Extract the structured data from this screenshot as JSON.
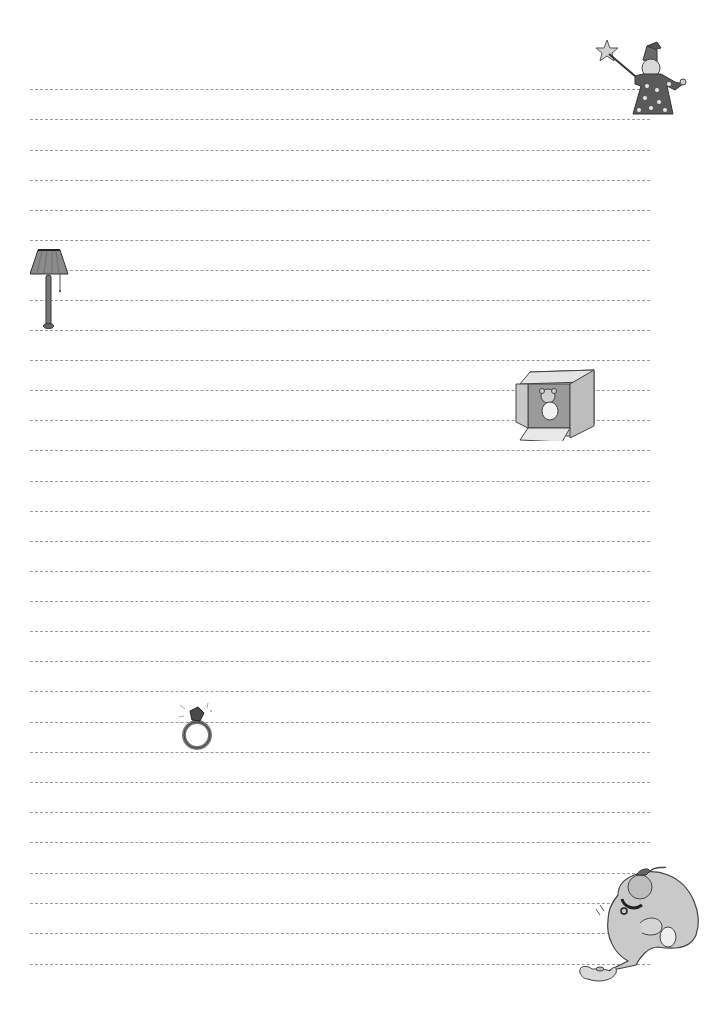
{
  "page": {
    "type": "lined writing paper",
    "background": "#ffffff",
    "line_color": "#9a9a9a",
    "line_style": "dashed",
    "line_count": 30,
    "line_left": 30,
    "line_width": 620,
    "line_positions_y": [
      89,
      119,
      150,
      180,
      210,
      240,
      270,
      300,
      330,
      360,
      390,
      420,
      450,
      481,
      511,
      541,
      571,
      601,
      631,
      661,
      691,
      722,
      752,
      782,
      812,
      842,
      873,
      903,
      933,
      964
    ]
  },
  "illustrations": [
    {
      "name": "wizard",
      "icon": "wizard-icon",
      "x": 595,
      "y": 38,
      "w": 105,
      "h": 80
    },
    {
      "name": "floor-lamp",
      "icon": "lamp-icon",
      "x": 30,
      "y": 248,
      "w": 40,
      "h": 82
    },
    {
      "name": "teddy-bear-in-box",
      "icon": "box-icon",
      "x": 502,
      "y": 366,
      "w": 96,
      "h": 75
    },
    {
      "name": "diamond-ring",
      "icon": "ring-icon",
      "x": 176,
      "y": 697,
      "w": 38,
      "h": 55
    },
    {
      "name": "genie-with-lamp",
      "icon": "genie-icon",
      "x": 578,
      "y": 865,
      "w": 132,
      "h": 122
    }
  ]
}
